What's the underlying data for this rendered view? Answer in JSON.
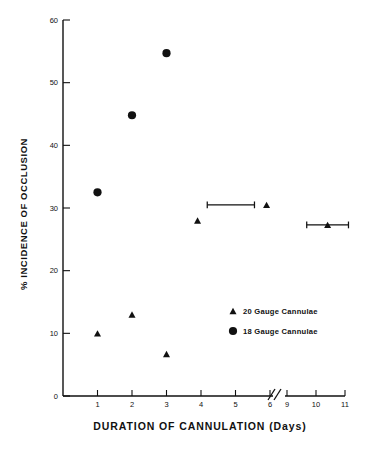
{
  "chart_data": {
    "type": "scatter",
    "title": "",
    "xlabel": "DURATION OF CANNULATION (Days)",
    "ylabel": "% INCIDENCE OF OCCLUSION",
    "xlim": [
      0,
      11
    ],
    "ylim": [
      0,
      60
    ],
    "grid": false,
    "axis_break": {
      "present": true,
      "between": [
        6,
        9
      ],
      "symbol": "//"
    },
    "xticks": [
      {
        "value": 1,
        "label": "1"
      },
      {
        "value": 2,
        "label": "2"
      },
      {
        "value": 3,
        "label": "3"
      },
      {
        "value": 4,
        "label": "4"
      },
      {
        "value": 5,
        "label": "5"
      },
      {
        "value": 6,
        "label": "6"
      },
      {
        "value": 9,
        "label": "9"
      },
      {
        "value": 10,
        "label": "10"
      },
      {
        "value": 11,
        "label": "11"
      }
    ],
    "yticks": [
      {
        "value": 0,
        "label": "0"
      },
      {
        "value": 10,
        "label": "10"
      },
      {
        "value": 20,
        "label": "20"
      },
      {
        "value": 30,
        "label": "30"
      },
      {
        "value": 40,
        "label": "40"
      },
      {
        "value": 50,
        "label": "50"
      },
      {
        "value": 60,
        "label": "60"
      }
    ],
    "legend": {
      "position": "inside-lower-right",
      "entries": [
        {
          "marker": "triangle",
          "label": "20 Gauge Cannulae"
        },
        {
          "marker": "circle",
          "label": "18 Gauge Cannulae"
        }
      ]
    },
    "series": [
      {
        "name": "20 Gauge Cannulae",
        "marker": "triangle",
        "color": "#111111",
        "points": [
          {
            "x": 1.0,
            "y": 10.0,
            "xerr": 0
          },
          {
            "x": 2.0,
            "y": 13.0,
            "xerr": 0
          },
          {
            "x": 3.0,
            "y": 6.7,
            "xerr": 0
          },
          {
            "x": 3.9,
            "y": 28.0,
            "xerr": 0
          },
          {
            "x": 5.9,
            "y": 30.5,
            "xerr": 0.35
          },
          {
            "x": 10.4,
            "y": 27.3,
            "xerr": 0.72
          }
        ]
      },
      {
        "name": "18 Gauge Cannulae",
        "marker": "circle",
        "color": "#111111",
        "points": [
          {
            "x": 1.0,
            "y": 32.5,
            "xerr": 0
          },
          {
            "x": 2.0,
            "y": 44.8,
            "xerr": 0
          },
          {
            "x": 3.0,
            "y": 54.7,
            "xerr": 0
          }
        ]
      }
    ]
  }
}
